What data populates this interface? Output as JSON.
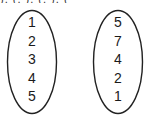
{
  "top_fragment": "), (, ), (, ), (",
  "sets": {
    "left": {
      "elements": [
        "1",
        "2",
        "3",
        "4",
        "5"
      ]
    },
    "right": {
      "elements": [
        "5",
        "7",
        "4",
        "2",
        "1"
      ]
    }
  },
  "colors": {
    "stroke": "#222222",
    "text": "#1a1a1a",
    "background": "#ffffff"
  }
}
